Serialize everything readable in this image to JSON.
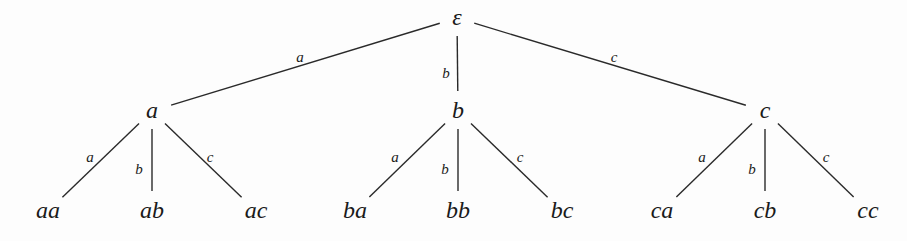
{
  "diagram": {
    "type": "tree",
    "colors": {
      "background": "#fdfdfd",
      "ink": "#1a1a1a"
    },
    "root": {
      "id": "root",
      "label": "ε",
      "x": 457,
      "y": 25
    },
    "level1": [
      {
        "id": "n_a",
        "label": "a",
        "x": 152,
        "y": 118,
        "edge_label": "a",
        "edge_label_x": 300,
        "edge_label_y": 62
      },
      {
        "id": "n_b",
        "label": "b",
        "x": 458,
        "y": 118,
        "edge_label": "b",
        "edge_label_x": 446,
        "edge_label_y": 78
      },
      {
        "id": "n_c",
        "label": "c",
        "x": 765,
        "y": 118,
        "edge_label": "c",
        "edge_label_x": 614,
        "edge_label_y": 62
      }
    ],
    "leaves": [
      {
        "parent": 0,
        "label": "aa",
        "x": 48,
        "y": 218,
        "edge_label": "a",
        "edge_label_x": 90,
        "edge_label_y": 162
      },
      {
        "parent": 0,
        "label": "ab",
        "x": 152,
        "y": 218,
        "edge_label": "b",
        "edge_label_x": 139,
        "edge_label_y": 174
      },
      {
        "parent": 0,
        "label": "ac",
        "x": 256,
        "y": 218,
        "edge_label": "c",
        "edge_label_x": 210,
        "edge_label_y": 162
      },
      {
        "parent": 1,
        "label": "ba",
        "x": 355,
        "y": 218,
        "edge_label": "a",
        "edge_label_x": 395,
        "edge_label_y": 162
      },
      {
        "parent": 1,
        "label": "bb",
        "x": 458,
        "y": 218,
        "edge_label": "b",
        "edge_label_x": 445,
        "edge_label_y": 174
      },
      {
        "parent": 1,
        "label": "bc",
        "x": 562,
        "y": 218,
        "edge_label": "c",
        "edge_label_x": 520,
        "edge_label_y": 162
      },
      {
        "parent": 2,
        "label": "ca",
        "x": 662,
        "y": 218,
        "edge_label": "a",
        "edge_label_x": 702,
        "edge_label_y": 162
      },
      {
        "parent": 2,
        "label": "cb",
        "x": 765,
        "y": 218,
        "edge_label": "b",
        "edge_label_x": 752,
        "edge_label_y": 174
      },
      {
        "parent": 2,
        "label": "cc",
        "x": 868,
        "y": 218,
        "edge_label": "c",
        "edge_label_x": 826,
        "edge_label_y": 162
      }
    ]
  }
}
